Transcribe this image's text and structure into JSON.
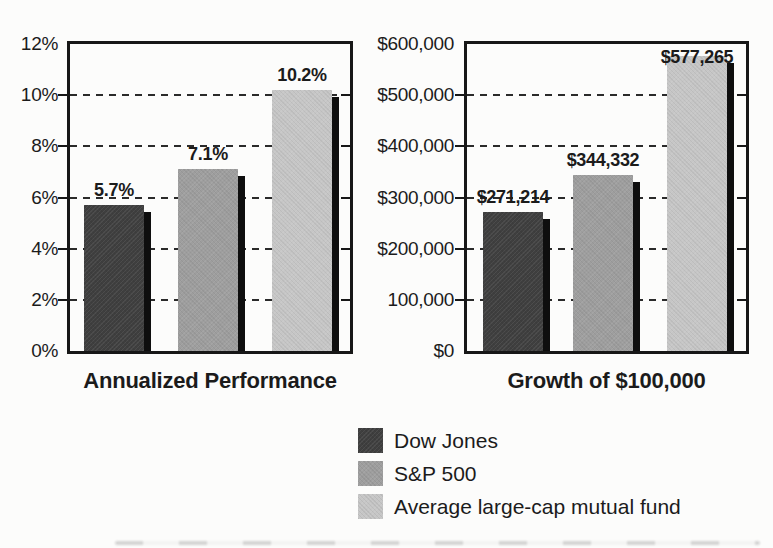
{
  "figure": {
    "background": "#fcfcfb"
  },
  "series": [
    {
      "name": "Dow Jones",
      "color": "#3f3f3f"
    },
    {
      "name": "S&P 500",
      "color": "#9e9e9e"
    },
    {
      "name": "Average large-cap mutual fund",
      "color": "#c6c6c6"
    }
  ],
  "legend": {
    "position": "bottom",
    "items": [
      {
        "label": "Dow Jones",
        "swatch_color": "#3f3f3f"
      },
      {
        "label": "S&P 500",
        "swatch_color": "#9e9e9e"
      },
      {
        "label": "Average large-cap mutual fund",
        "swatch_color": "#c6c6c6"
      }
    ]
  },
  "chart_data": [
    {
      "type": "bar",
      "title": "Annualized Performance",
      "categories": [
        "Dow Jones",
        "S&P 500",
        "Average large-cap mutual fund"
      ],
      "values": [
        5.7,
        7.1,
        10.2
      ],
      "data_labels": [
        "5.7%",
        "7.1%",
        "10.2%"
      ],
      "unit": "percent",
      "ylim": [
        0,
        12
      ],
      "yticks": [
        {
          "value": 12,
          "label": "12%"
        },
        {
          "value": 10,
          "label": "10%"
        },
        {
          "value": 8,
          "label": "8%"
        },
        {
          "value": 6,
          "label": "6%"
        },
        {
          "value": 4,
          "label": "4%"
        },
        {
          "value": 2,
          "label": "2%"
        },
        {
          "value": 0,
          "label": "0%"
        }
      ],
      "gridlines": {
        "style": "dashed",
        "values": [
          2,
          4,
          6,
          8,
          10
        ]
      },
      "bar_colors": [
        "#3f3f3f",
        "#9e9e9e",
        "#c6c6c6"
      ]
    },
    {
      "type": "bar",
      "title": "Growth of $100,000",
      "categories": [
        "Dow Jones",
        "S&P 500",
        "Average large-cap mutual fund"
      ],
      "values": [
        271214,
        344332,
        577265
      ],
      "data_labels": [
        "$271,214",
        "$344,332",
        "$577,265"
      ],
      "unit": "dollars",
      "ylim": [
        0,
        600000
      ],
      "yticks": [
        {
          "value": 600000,
          "label": "$600,000"
        },
        {
          "value": 500000,
          "label": "$500,000"
        },
        {
          "value": 400000,
          "label": "$400,000"
        },
        {
          "value": 300000,
          "label": "$300,000"
        },
        {
          "value": 200000,
          "label": "$200,000"
        },
        {
          "value": 100000,
          "label": "100,000"
        },
        {
          "value": 0,
          "label": "$0"
        }
      ],
      "gridlines": {
        "style": "dashed",
        "values": [
          100000,
          200000,
          300000,
          400000,
          500000
        ]
      },
      "bar_colors": [
        "#3f3f3f",
        "#9e9e9e",
        "#c6c6c6"
      ]
    }
  ]
}
